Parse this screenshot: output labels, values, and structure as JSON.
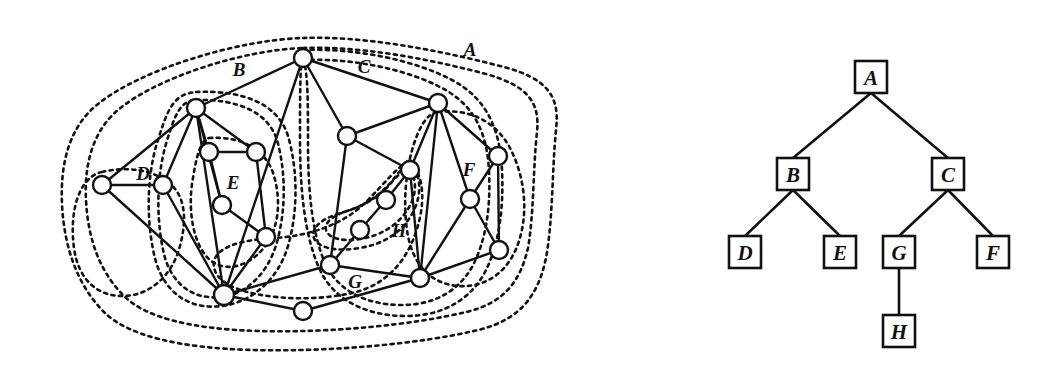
{
  "figure": {
    "background": "#ffffff",
    "ink_color": "#111111"
  },
  "graph_panel": {
    "name": "clustered-graph",
    "region_labels": [
      {
        "id": "A",
        "text": "A",
        "x": 470,
        "y": 56
      },
      {
        "id": "B",
        "text": "B",
        "x": 239,
        "y": 76
      },
      {
        "id": "C",
        "text": "C",
        "x": 364,
        "y": 73
      },
      {
        "id": "D",
        "text": "D",
        "x": 143,
        "y": 180
      },
      {
        "id": "E",
        "text": "E",
        "x": 233,
        "y": 189
      },
      {
        "id": "F",
        "text": "F",
        "x": 469,
        "y": 176
      },
      {
        "id": "G",
        "text": "G",
        "x": 355,
        "y": 288
      },
      {
        "id": "H",
        "text": "H",
        "x": 399,
        "y": 237
      }
    ],
    "vertices": [
      {
        "id": "v1",
        "x": 303,
        "y": 58,
        "r": 9
      },
      {
        "id": "v2",
        "x": 196,
        "y": 108,
        "r": 9
      },
      {
        "id": "v3",
        "x": 438,
        "y": 103,
        "r": 9
      },
      {
        "id": "v4",
        "x": 102,
        "y": 185,
        "r": 9
      },
      {
        "id": "v5",
        "x": 163,
        "y": 185,
        "r": 9
      },
      {
        "id": "v6",
        "x": 209,
        "y": 152,
        "r": 9
      },
      {
        "id": "v7",
        "x": 256,
        "y": 152,
        "r": 9
      },
      {
        "id": "v8",
        "x": 222,
        "y": 205,
        "r": 9
      },
      {
        "id": "v9",
        "x": 266,
        "y": 237,
        "r": 9
      },
      {
        "id": "v10",
        "x": 224,
        "y": 295,
        "r": 10
      },
      {
        "id": "v11",
        "x": 303,
        "y": 311,
        "r": 9
      },
      {
        "id": "v12",
        "x": 330,
        "y": 265,
        "r": 9
      },
      {
        "id": "v13",
        "x": 347,
        "y": 136,
        "r": 9
      },
      {
        "id": "v14",
        "x": 410,
        "y": 170,
        "r": 9
      },
      {
        "id": "v15",
        "x": 386,
        "y": 200,
        "r": 9
      },
      {
        "id": "v16",
        "x": 360,
        "y": 230,
        "r": 9
      },
      {
        "id": "v17",
        "x": 420,
        "y": 278,
        "r": 9
      },
      {
        "id": "v18",
        "x": 498,
        "y": 156,
        "r": 9
      },
      {
        "id": "v19",
        "x": 470,
        "y": 199,
        "r": 9
      },
      {
        "id": "v20",
        "x": 499,
        "y": 250,
        "r": 9
      }
    ],
    "edges": [
      [
        "v1",
        "v2"
      ],
      [
        "v1",
        "v3"
      ],
      [
        "v1",
        "v13"
      ],
      [
        "v1",
        "v10"
      ],
      [
        "v2",
        "v4"
      ],
      [
        "v2",
        "v5"
      ],
      [
        "v2",
        "v6"
      ],
      [
        "v2",
        "v7"
      ],
      [
        "v2",
        "v8"
      ],
      [
        "v2",
        "v10"
      ],
      [
        "v4",
        "v5"
      ],
      [
        "v4",
        "v10"
      ],
      [
        "v5",
        "v10"
      ],
      [
        "v6",
        "v7"
      ],
      [
        "v6",
        "v8"
      ],
      [
        "v7",
        "v9"
      ],
      [
        "v8",
        "v9"
      ],
      [
        "v9",
        "v10"
      ],
      [
        "v10",
        "v11"
      ],
      [
        "v10",
        "v12"
      ],
      [
        "v11",
        "v17"
      ],
      [
        "v12",
        "v13"
      ],
      [
        "v12",
        "v16"
      ],
      [
        "v12",
        "v17"
      ],
      [
        "v13",
        "v3"
      ],
      [
        "v13",
        "v14"
      ],
      [
        "v14",
        "v3"
      ],
      [
        "v14",
        "v15"
      ],
      [
        "v14",
        "v17"
      ],
      [
        "v15",
        "v16"
      ],
      [
        "v3",
        "v18"
      ],
      [
        "v3",
        "v19"
      ],
      [
        "v3",
        "v17"
      ],
      [
        "v18",
        "v19"
      ],
      [
        "v18",
        "v20"
      ],
      [
        "v19",
        "v20"
      ],
      [
        "v19",
        "v17"
      ],
      [
        "v20",
        "v17"
      ]
    ],
    "regions": [
      {
        "id": "A",
        "path": "M 303 38 C 360 36 430 48 500 66 C 548 78 560 96 556 130 C 552 170 553 220 546 258 C 538 296 520 320 478 330 C 420 344 330 352 252 350 C 180 348 128 336 104 312 C 78 286 64 248 62 204 C 60 162 70 126 98 104 C 140 70 236 40 303 38 Z"
      },
      {
        "id": "A-inner",
        "path": "M 303 48 C 356 46 422 57 486 74 C 528 86 540 102 537 132 C 533 168 534 214 528 248 C 520 282 504 303 466 312 C 412 325 330 333 258 331 C 192 329 146 318 124 296 C 100 272 88 240 86 200 C 84 162 94 130 118 110 C 156 78 242 50 303 48 Z"
      },
      {
        "id": "B",
        "path": "M 196 92 C 244 90 278 104 288 136 C 298 170 298 212 288 246 C 278 280 252 302 222 306 C 190 310 166 294 156 262 C 146 226 146 176 158 140 C 168 108 174 94 196 92 Z"
      },
      {
        "id": "B-inner",
        "path": "M 196 100 C 238 99 268 112 277 140 C 286 172 286 210 277 242 C 268 274 246 294 222 297 C 194 300 174 286 165 258 C 156 224 156 178 166 144 C 175 114 180 101 196 100 Z"
      },
      {
        "id": "D",
        "path": "M 102 172 C 128 166 152 170 168 182 C 184 194 188 216 180 246 C 172 276 150 296 122 296 C 96 296 78 278 74 248 C 70 218 76 192 88 180 C 93 175 97 173 102 172 Z"
      },
      {
        "id": "E",
        "path": "M 209 138 C 240 136 266 148 274 176 C 282 204 278 232 262 250 C 246 268 224 272 210 260 C 194 246 188 214 192 184 C 196 158 200 140 209 138 Z"
      },
      {
        "id": "C",
        "path": "M 303 50 C 356 48 414 60 452 80 C 486 98 500 128 502 170 C 504 212 498 248 484 274 C 468 302 440 316 406 316 C 366 316 334 300 320 270 C 304 236 300 186 300 140 C 300 96 300 62 303 50 Z"
      },
      {
        "id": "C-inner",
        "path": "M 303 60 C 352 58 406 69 442 88 C 474 105 487 132 489 171 C 491 210 485 243 472 267 C 457 293 432 305 402 305 C 366 305 338 291 325 263 C 311 231 308 185 308 143 C 308 103 308 70 303 60 Z"
      },
      {
        "id": "F",
        "path": "M 438 112 C 470 108 498 122 512 152 C 526 182 528 216 518 244 C 508 272 486 288 458 286 C 432 284 414 266 408 236 C 402 204 406 164 416 138 C 423 120 430 113 438 112 Z"
      },
      {
        "id": "G",
        "path": "M 410 160 C 424 176 426 202 416 232 C 406 262 386 284 356 292 C 324 300 286 300 256 294 C 226 288 212 276 214 262 C 216 248 238 240 274 238 C 310 236 344 224 366 202 C 384 184 398 166 410 160 Z"
      },
      {
        "id": "H",
        "path": "M 410 162 C 422 176 422 196 412 214 C 402 232 384 244 360 248 C 336 252 318 248 314 238 C 310 228 322 218 344 212 C 366 206 384 192 396 176 C 402 168 406 163 410 162 Z"
      },
      {
        "id": "H-inner",
        "path": "M 410 170 C 418 182 416 198 406 212 C 396 226 380 236 360 239 C 342 242 328 238 326 230 C 324 222 334 215 350 210 C 368 204 382 194 392 182 C 398 174 405 170 410 170 Z"
      }
    ]
  },
  "tree_panel": {
    "name": "containment-tree",
    "nodes": [
      {
        "id": "A",
        "label": "A",
        "x": 871,
        "y": 77
      },
      {
        "id": "B",
        "label": "B",
        "x": 793,
        "y": 174
      },
      {
        "id": "C",
        "label": "C",
        "x": 948,
        "y": 174
      },
      {
        "id": "D",
        "label": "D",
        "x": 745,
        "y": 252
      },
      {
        "id": "E",
        "label": "E",
        "x": 840,
        "y": 252
      },
      {
        "id": "G",
        "label": "G",
        "x": 899,
        "y": 252
      },
      {
        "id": "F",
        "label": "F",
        "x": 993,
        "y": 252
      },
      {
        "id": "H",
        "label": "H",
        "x": 899,
        "y": 331
      }
    ],
    "box_size": 32,
    "edges": [
      [
        "A",
        "B"
      ],
      [
        "A",
        "C"
      ],
      [
        "B",
        "D"
      ],
      [
        "B",
        "E"
      ],
      [
        "C",
        "G"
      ],
      [
        "C",
        "F"
      ],
      [
        "G",
        "H"
      ]
    ]
  }
}
